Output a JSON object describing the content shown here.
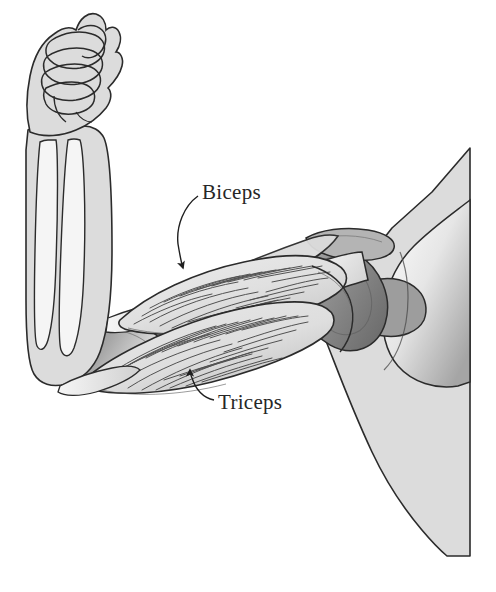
{
  "figure": {
    "type": "anatomical-illustration",
    "background_color": "#ffffff",
    "line_color": "#2b2b2b",
    "fills": {
      "skin": "#d8d8d8",
      "bone_light": "#f2f2f2",
      "bone_mid": "#c9c9c9",
      "bone_dark": "#8f8f8f",
      "muscle": "#e2e2e2",
      "shadow": "#9a9a9a",
      "deep_shadow": "#707070"
    }
  },
  "labels": [
    {
      "id": "biceps",
      "text": "Biceps",
      "x": 202,
      "y": 182,
      "leader": "curved-arrow-down-left",
      "points_to": {
        "x": 183,
        "y": 272
      }
    },
    {
      "id": "triceps",
      "text": "Triceps",
      "x": 218,
      "y": 392,
      "leader": "curved-arrow-up-left",
      "points_to": {
        "x": 190,
        "y": 368
      }
    }
  ],
  "structures": [
    {
      "name": "fist",
      "description": "clenched hand at top of raised forearm"
    },
    {
      "name": "forearm",
      "description": "vertical forearm containing radius and ulna"
    },
    {
      "name": "radius",
      "description": "lateral forearm bone"
    },
    {
      "name": "ulna",
      "description": "medial forearm bone"
    },
    {
      "name": "elbow-joint",
      "description": "hinge joint at lower left of humerus"
    },
    {
      "name": "humerus",
      "description": "upper arm bone running from elbow to shoulder"
    },
    {
      "name": "biceps-muscle",
      "description": "upper striated muscle belly, elbow flexor"
    },
    {
      "name": "triceps-muscle",
      "description": "lower striated muscle belly, elbow extensor"
    },
    {
      "name": "scapula",
      "description": "shoulder blade at right"
    },
    {
      "name": "clavicle",
      "description": "collarbone over shoulder joint"
    },
    {
      "name": "torso",
      "description": "trunk silhouette at right edge"
    }
  ]
}
